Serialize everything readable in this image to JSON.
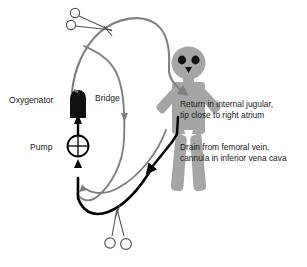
{
  "diagram": {
    "colors": {
      "body_gray": "#a5a5a5",
      "tubing_gray": "#808080",
      "tubing_black": "#000000",
      "device_black": "#111111",
      "text": "#1a1a1a",
      "background": "#ffffff"
    },
    "labels": {
      "oxygenator": "Oxygenator",
      "bridge": "Bridge",
      "pump": "Pump"
    },
    "annotations": {
      "return_line_1": "Return in internal jugular,",
      "return_line_2": "tip close to right atrium",
      "drain_line_1": "Drain from femoral vein,",
      "drain_line_2": "cannula in inferior vena cava"
    },
    "components": {
      "patient": "patient-figure",
      "oxygenator": "oxygenator-device",
      "pump": "pump-device",
      "bridge": "bridge-tube",
      "clamp_top": "clamp-top",
      "clamp_bottom": "clamp-bottom",
      "return_tube": "return-tube",
      "drain_tube": "drain-tube"
    }
  }
}
